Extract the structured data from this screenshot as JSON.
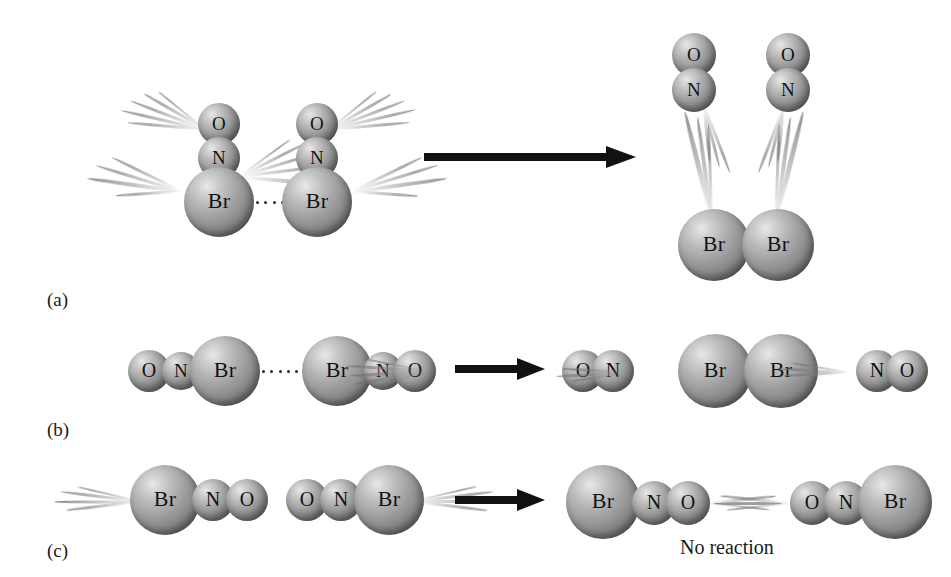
{
  "figure": {
    "width": 951,
    "height": 577,
    "background": "#ffffff",
    "ink": "#111111",
    "atom_shade_light": "#e8e8e8",
    "atom_shade_dark": "#5d5d5d"
  },
  "panels": [
    {
      "id": "a",
      "label": "(a)",
      "arrow_label": "reaction-arrow",
      "reactants": [
        {
          "molecule": "NOBr",
          "atoms": [
            "O",
            "N",
            "Br"
          ],
          "orientation": "vertical"
        },
        {
          "molecule": "NOBr",
          "atoms": [
            "O",
            "N",
            "Br"
          ],
          "orientation": "vertical"
        }
      ],
      "collision_contact": "Br ····· Br",
      "products": [
        {
          "molecule": "NO",
          "atoms": [
            "O",
            "N"
          ]
        },
        {
          "molecule": "NO",
          "atoms": [
            "O",
            "N"
          ]
        },
        {
          "molecule": "Br2",
          "atoms": [
            "Br",
            "Br"
          ]
        }
      ],
      "outcome": ""
    },
    {
      "id": "b",
      "label": "(b)",
      "arrow_label": "reaction-arrow",
      "reactants": [
        {
          "molecule": "NOBr",
          "atoms": [
            "O",
            "N",
            "Br"
          ],
          "orientation": "horizontal"
        },
        {
          "molecule": "NOBr",
          "atoms": [
            "Br",
            "N",
            "O"
          ],
          "orientation": "horizontal"
        }
      ],
      "collision_contact": "Br ····· Br",
      "products": [
        {
          "molecule": "NO",
          "atoms": [
            "O",
            "N"
          ]
        },
        {
          "molecule": "Br2",
          "atoms": [
            "Br",
            "Br"
          ]
        },
        {
          "molecule": "NO",
          "atoms": [
            "N",
            "O"
          ]
        }
      ],
      "outcome": ""
    },
    {
      "id": "c",
      "label": "(c)",
      "arrow_label": "reaction-arrow",
      "reactants": [
        {
          "molecule": "NOBr",
          "atoms": [
            "Br",
            "N",
            "O"
          ],
          "orientation": "horizontal"
        },
        {
          "molecule": "NOBr",
          "atoms": [
            "O",
            "N",
            "Br"
          ],
          "orientation": "horizontal"
        }
      ],
      "collision_contact": "O ··· O",
      "products": [
        {
          "molecule": "NOBr",
          "atoms": [
            "Br",
            "N",
            "O"
          ]
        },
        {
          "molecule": "NOBr",
          "atoms": [
            "O",
            "N",
            "Br"
          ]
        }
      ],
      "outcome": "No reaction"
    }
  ],
  "atom_labels": {
    "oxygen": "O",
    "nitrogen": "N",
    "bromine": "Br"
  }
}
